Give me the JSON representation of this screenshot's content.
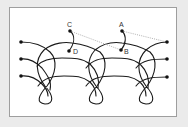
{
  "diagram": {
    "type": "knot-braid",
    "colors": {
      "background": "#ebebeb",
      "panel": "#ffffff",
      "border": "#9e9e9e",
      "strand": "#1a1a1a",
      "dotted": "#9a9a9a"
    },
    "labels": {
      "a": "A",
      "b": "B",
      "c": "C",
      "d": "D"
    },
    "strands": 3,
    "knot_clusters": 3,
    "endpoints_left": 3,
    "endpoints_right": 3,
    "dotted_links": [
      "C-B",
      "A-right-top"
    ]
  }
}
